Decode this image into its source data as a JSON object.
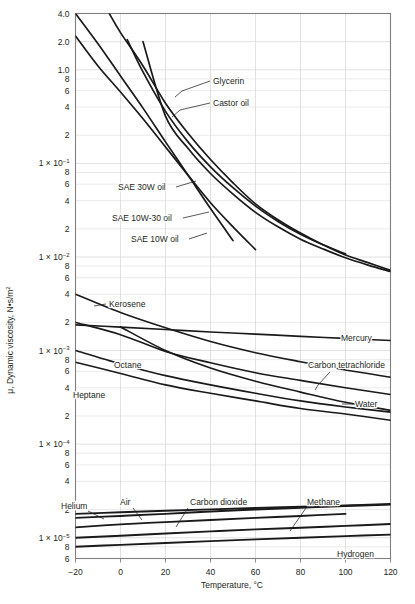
{
  "chart_data": {
    "type": "line",
    "title": "",
    "xlabel": "Temperature, °C",
    "ylabel": "μ, Dynamic viscosity, N•s/m²",
    "xlim": [
      -20,
      120
    ],
    "ylim": [
      6e-06,
      4.0
    ],
    "yscale": "log",
    "xscale": "linear",
    "grid": true,
    "legend_position": "inline-annotations",
    "xticks": [
      -20,
      0,
      20,
      40,
      60,
      80,
      100,
      120
    ],
    "xticklabels": [
      "-20",
      "0",
      "20",
      "40",
      "60",
      "80",
      "100",
      "120"
    ],
    "yticklabels": [
      "4.0",
      "2.0",
      "1.0",
      "8",
      "6",
      "4",
      "2",
      "1 × 10-1",
      "8",
      "6",
      "4",
      "2",
      "1 × 10-2",
      "8",
      "6",
      "4",
      "2",
      "1 × 10-3",
      "8",
      "6",
      "4",
      "2",
      "1 × 10-4",
      "8",
      "6",
      "4",
      "2",
      "1 × 10-5",
      "8",
      "6"
    ],
    "series": [
      {
        "name": "Glycerin",
        "group": "oil",
        "x": [
          -20,
          -10,
          0,
          10,
          20,
          30,
          40,
          50
        ],
        "y": [
          4.0,
          1.9,
          0.86,
          0.39,
          0.17,
          0.075,
          0.033,
          0.015
        ]
      },
      {
        "name": "Castor oil",
        "group": "oil",
        "x": [
          -20,
          -10,
          0,
          10,
          20,
          30,
          40,
          50,
          60
        ],
        "y": [
          2.3,
          1.1,
          0.58,
          0.3,
          0.15,
          0.075,
          0.038,
          0.021,
          0.012
        ]
      },
      {
        "name": "SAE 30W oil",
        "group": "oil",
        "x": [
          -5,
          0,
          10,
          20,
          30,
          40,
          50,
          60,
          70,
          80,
          90,
          100,
          110,
          120
        ],
        "y": [
          4.0,
          2.5,
          1.1,
          0.44,
          0.21,
          0.11,
          0.062,
          0.037,
          0.025,
          0.018,
          0.0135,
          0.0105,
          0.0087,
          0.0072
        ]
      },
      {
        "name": "SAE 10W-30 oil",
        "group": "oil",
        "x": [
          3,
          10,
          20,
          30,
          40,
          50,
          60,
          70,
          80,
          90,
          100
        ],
        "y": [
          2.1,
          0.95,
          0.36,
          0.17,
          0.092,
          0.055,
          0.035,
          0.024,
          0.0175,
          0.0135,
          0.0108
        ]
      },
      {
        "name": "SAE 10W oil",
        "group": "oil",
        "x": [
          10,
          20,
          30,
          40,
          50,
          60,
          70,
          80,
          90,
          100,
          110,
          120
        ],
        "y": [
          2.0,
          0.32,
          0.145,
          0.078,
          0.047,
          0.03,
          0.021,
          0.0155,
          0.0122,
          0.0098,
          0.0082,
          0.007
        ]
      },
      {
        "name": "Mercury",
        "group": "liquid",
        "x": [
          -20,
          0,
          20,
          40,
          60,
          80,
          100,
          120
        ],
        "y": [
          0.00188,
          0.00178,
          0.00168,
          0.00158,
          0.0015,
          0.00142,
          0.00135,
          0.00128
        ]
      },
      {
        "name": "Kerosene",
        "group": "liquid",
        "x": [
          -20,
          0,
          20,
          40,
          60,
          80,
          100,
          120
        ],
        "y": [
          0.004,
          0.00255,
          0.00175,
          0.00125,
          0.00095,
          0.00076,
          0.00062,
          0.00052
        ]
      },
      {
        "name": "Carbon tetrachloride",
        "group": "liquid",
        "x": [
          -20,
          0,
          20,
          40,
          60,
          80,
          100,
          120
        ],
        "y": [
          0.002,
          0.00148,
          0.00098,
          0.00074,
          0.00058,
          0.00048,
          0.0004,
          0.00034
        ]
      },
      {
        "name": "Octane",
        "group": "liquid",
        "x": [
          -20,
          0,
          20,
          40,
          60,
          80,
          100,
          120
        ],
        "y": [
          0.001,
          0.00072,
          0.00054,
          0.00043,
          0.00035,
          0.00029,
          0.00025,
          0.00022
        ]
      },
      {
        "name": "Heptane",
        "group": "liquid",
        "x": [
          -20,
          0,
          20,
          40,
          60,
          80,
          100,
          120
        ],
        "y": [
          0.00075,
          0.00057,
          0.00043,
          0.00035,
          0.00029,
          0.00024,
          0.00021,
          0.00018
        ]
      },
      {
        "name": "Water",
        "group": "liquid",
        "x": [
          0,
          20,
          40,
          60,
          80,
          100,
          120
        ],
        "y": [
          0.00179,
          0.001,
          0.00065,
          0.00047,
          0.00036,
          0.00028,
          0.00023
        ]
      },
      {
        "name": "Carbon dioxide",
        "group": "gas",
        "x": [
          -20,
          0,
          20,
          40,
          60,
          80,
          100
        ],
        "y": [
          1.29e-05,
          1.39e-05,
          1.47e-05,
          1.55e-05,
          1.63e-05,
          1.71e-05,
          1.8e-05
        ]
      },
      {
        "name": "Air",
        "group": "gas",
        "x": [
          -20,
          0,
          20,
          40,
          60,
          80,
          100,
          120
        ],
        "y": [
          1.63e-05,
          1.71e-05,
          1.8e-05,
          1.91e-05,
          2e-05,
          2.09e-05,
          2.18e-05,
          2.26e-05
        ]
      },
      {
        "name": "Helium",
        "group": "gas",
        "x": [
          -20,
          0,
          20,
          40,
          60,
          80,
          100,
          120
        ],
        "y": [
          1.8e-05,
          1.87e-05,
          1.94e-05,
          2.01e-05,
          2.08e-05,
          2.15e-05,
          2.22e-05,
          2.29e-05
        ]
      },
      {
        "name": "Methane",
        "group": "gas",
        "x": [
          -20,
          0,
          20,
          40,
          60,
          80,
          100,
          120
        ],
        "y": [
          1e-05,
          1.05e-05,
          1.11e-05,
          1.17e-05,
          1.23e-05,
          1.28e-05,
          1.34e-05,
          1.4e-05
        ]
      },
      {
        "name": "Hydrogen",
        "group": "gas",
        "x": [
          -20,
          0,
          20,
          40,
          60,
          80,
          100,
          120
        ],
        "y": [
          8e-06,
          8.4e-06,
          8.8e-06,
          9.2e-06,
          9.6e-06,
          1e-05,
          1.04e-05,
          1.08e-05
        ]
      }
    ],
    "annotations": [
      {
        "label": "Glycerin",
        "text_x": 213,
        "text_y": 84,
        "leader": [
          [
            210,
            81
          ],
          [
            182,
            91
          ],
          [
            175,
            97
          ]
        ]
      },
      {
        "label": "Castor oil",
        "text_x": 213,
        "text_y": 106,
        "leader": [
          [
            210,
            103
          ],
          [
            180,
            110
          ],
          [
            172,
            117
          ]
        ]
      },
      {
        "label": "SAE 30W oil",
        "text_x": 118,
        "text_y": 190,
        "leader": [
          [
            176,
            187
          ],
          [
            196,
            181
          ]
        ]
      },
      {
        "label": "SAE 10W-30 oil",
        "text_x": 112,
        "text_y": 221,
        "leader": [
          [
            183,
            218
          ],
          [
            209,
            212
          ]
        ]
      },
      {
        "label": "SAE 10W oil",
        "text_x": 131,
        "text_y": 242,
        "leader": [
          [
            189,
            239
          ],
          [
            207,
            233
          ]
        ]
      },
      {
        "label": "Kerosene",
        "text_x": 109,
        "text_y": 307,
        "leader": [
          [
            106,
            304
          ],
          [
            94,
            306
          ]
        ]
      },
      {
        "label": "Mercury",
        "text_x": 341,
        "text_y": 341,
        "leader": []
      },
      {
        "label": "Octane",
        "text_x": 114,
        "text_y": 368,
        "leader": []
      },
      {
        "label": "Carbon tetrachloride",
        "text_x": 308,
        "text_y": 368,
        "leader": [
          [
            330,
            372
          ],
          [
            318,
            385
          ],
          [
            315,
            390
          ]
        ]
      },
      {
        "label": "Heptane",
        "text_x": 73,
        "text_y": 398,
        "leader": []
      },
      {
        "label": "Water",
        "text_x": 355,
        "text_y": 407,
        "leader": [
          [
            353,
            404
          ],
          [
            342,
            404
          ]
        ]
      },
      {
        "label": "Helium",
        "text_x": 61,
        "text_y": 509,
        "leader": [
          [
            88,
            511
          ],
          [
            104,
            519
          ]
        ]
      },
      {
        "label": "Air",
        "text_x": 120,
        "text_y": 505,
        "leader": [
          [
            133,
            508
          ],
          [
            142,
            520
          ]
        ]
      },
      {
        "label": "Carbon dioxide",
        "text_x": 190,
        "text_y": 505,
        "leader": [
          [
            188,
            508
          ],
          [
            176,
            527
          ]
        ]
      },
      {
        "label": "Methane",
        "text_x": 307,
        "text_y": 505,
        "leader": [
          [
            306,
            508
          ],
          [
            290,
            531
          ]
        ]
      },
      {
        "label": "Hydrogen",
        "text_x": 337,
        "text_y": 557,
        "leader": []
      }
    ],
    "colors": {
      "curve": "#1a1a1a",
      "grid": "#d9d9d9",
      "axis": "#808080",
      "text": "#231f20",
      "background": "#ffffff"
    }
  }
}
